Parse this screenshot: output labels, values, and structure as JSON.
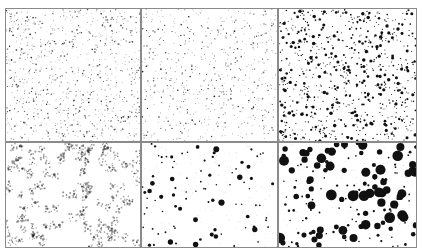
{
  "figure": {
    "layout": "2 rows x 3 columns",
    "panels": [
      {
        "id": "a",
        "pattern": "fine sparse dots",
        "density": "high",
        "dot_size": "tiny",
        "fuzzy": false
      },
      {
        "id": "b",
        "pattern": "fine sparse dots",
        "density": "medium",
        "dot_size": "tiny",
        "fuzzy": false
      },
      {
        "id": "c",
        "pattern": "dense small dots",
        "density": "high",
        "dot_size": "small",
        "fuzzy": false
      },
      {
        "id": "d",
        "pattern": "fuzzy clusters",
        "density": "medium",
        "dot_size": "small",
        "fuzzy": true
      },
      {
        "id": "e",
        "pattern": "sparse blotches",
        "density": "low",
        "dot_size": "medium",
        "fuzzy": false
      },
      {
        "id": "f",
        "pattern": "large droplets",
        "density": "medium",
        "dot_size": "large",
        "fuzzy": false
      }
    ],
    "colors": {
      "dot": "#111111",
      "border": "#8a8a8a",
      "background": "#ffffff"
    }
  }
}
